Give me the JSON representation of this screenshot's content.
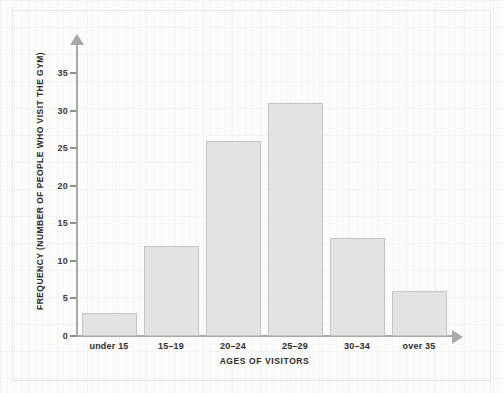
{
  "chart_data": {
    "type": "bar",
    "title": "",
    "subtitle": "",
    "xlabel": "AGES OF VISITORS",
    "ylabel": "FREQUENCY (NUMBER OF PEOPLE WHO VISIT THE GYM)",
    "categories": [
      "under 15",
      "15–19",
      "20–24",
      "25–29",
      "30–34",
      "over 35"
    ],
    "values": [
      3,
      12,
      26,
      31,
      13,
      6
    ],
    "ylim": [
      0,
      35
    ],
    "ytick_labels": [
      "0",
      "5",
      "10",
      "15",
      "20",
      "25",
      "30",
      "35"
    ],
    "ytick_values": [
      0,
      5,
      10,
      15,
      20,
      25,
      30,
      35
    ],
    "ytick_step": 5,
    "grid": false,
    "legend": null,
    "legend_position": "none",
    "annotations": [],
    "colors": {
      "bar_fill": "#e3e3e3",
      "bar_border": "#c3c3c3",
      "axis": "#a8a8a8",
      "tick": "#8f8f8f",
      "text": "#2b2b2b",
      "background": "#fbfbfa",
      "frame": "#e6e6e6"
    }
  }
}
